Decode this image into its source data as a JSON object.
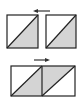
{
  "diagram": {
    "colors": {
      "stroke": "#222222",
      "fill_light": "#ffffff",
      "fill_shaded": "#d4d4d4",
      "arrow": "#333333"
    },
    "top_row": {
      "arrow_direction": "left",
      "squares": [
        {
          "id": "top-left",
          "shaded": "lower-right"
        },
        {
          "id": "top-right",
          "shaded": "lower-right"
        }
      ]
    },
    "bottom_row": {
      "arrow_direction": "right",
      "squares": [
        {
          "id": "bottom-left",
          "shaded": "lower-right"
        },
        {
          "id": "bottom-right",
          "shaded": "upper-left"
        }
      ]
    }
  }
}
